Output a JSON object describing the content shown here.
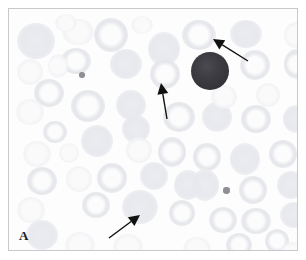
{
  "figure": {
    "panel_label": "A",
    "caption_alt": "Peripheral blood smear micrograph",
    "frame_color": "#c9c9cd",
    "background_color": "#fdfdfd"
  },
  "colors": {
    "background": "#fdfdfd",
    "red_blood_cell": "#e3e5e9",
    "leukocyte_dark": "#3b3b41",
    "platelet": "#8e8e93",
    "arrow": "#111111",
    "frame": "#c9c9cd"
  },
  "annotations": {
    "arrows": [
      {
        "id": "arrow-top-right",
        "label": "arrow-top-right",
        "direction": "up-left",
        "tip_x": 204,
        "tip_y": 30,
        "tail_x": 239,
        "tail_y": 52
      },
      {
        "id": "arrow-middle",
        "label": "arrow-middle",
        "direction": "up",
        "tip_x": 152,
        "tip_y": 74,
        "tail_x": 158,
        "tail_y": 110
      },
      {
        "id": "arrow-bottom",
        "label": "arrow-bottom",
        "direction": "up-right",
        "tip_x": 131,
        "tip_y": 206,
        "tail_x": 100,
        "tail_y": 229
      }
    ]
  },
  "cells": {
    "leukocyte": {
      "cx": 201,
      "cy": 62,
      "r": 19
    },
    "platelets": [
      {
        "cx": 73,
        "cy": 66,
        "r": 3
      },
      {
        "cx": 217,
        "cy": 181,
        "r": 3.5
      }
    ],
    "red_blood_cells": [
      {
        "cx": 27,
        "cy": 32,
        "rx": 19,
        "ry": 18,
        "style": "solid"
      },
      {
        "cx": 69,
        "cy": 23,
        "rx": 16,
        "ry": 13,
        "style": "faint"
      },
      {
        "cx": 67,
        "cy": 52,
        "rx": 15,
        "ry": 13,
        "style": "ring"
      },
      {
        "cx": 49,
        "cy": 57,
        "rx": 10,
        "ry": 12,
        "style": "faint"
      },
      {
        "cx": 102,
        "cy": 26,
        "rx": 17,
        "ry": 17,
        "style": "ring"
      },
      {
        "cx": 117,
        "cy": 55,
        "rx": 16,
        "ry": 15,
        "style": "solid"
      },
      {
        "cx": 155,
        "cy": 40,
        "rx": 16,
        "ry": 17,
        "style": "solid"
      },
      {
        "cx": 156,
        "cy": 65,
        "rx": 15,
        "ry": 15,
        "style": "ring"
      },
      {
        "cx": 190,
        "cy": 26,
        "rx": 17,
        "ry": 15,
        "style": "ring"
      },
      {
        "cx": 237,
        "cy": 25,
        "rx": 16,
        "ry": 14,
        "style": "solid"
      },
      {
        "cx": 246,
        "cy": 56,
        "rx": 15,
        "ry": 15,
        "style": "ring"
      },
      {
        "cx": 288,
        "cy": 55,
        "rx": 13,
        "ry": 15,
        "style": "ring"
      },
      {
        "cx": 287,
        "cy": 26,
        "rx": 12,
        "ry": 13,
        "style": "faint"
      },
      {
        "cx": 21,
        "cy": 63,
        "rx": 13,
        "ry": 13,
        "style": "faint"
      },
      {
        "cx": 40,
        "cy": 84,
        "rx": 15,
        "ry": 14,
        "style": "ring"
      },
      {
        "cx": 21,
        "cy": 103,
        "rx": 14,
        "ry": 13,
        "style": "faint"
      },
      {
        "cx": 79,
        "cy": 97,
        "rx": 17,
        "ry": 16,
        "style": "ring"
      },
      {
        "cx": 122,
        "cy": 96,
        "rx": 15,
        "ry": 15,
        "style": "solid"
      },
      {
        "cx": 127,
        "cy": 120,
        "rx": 14,
        "ry": 14,
        "style": "solid"
      },
      {
        "cx": 170,
        "cy": 108,
        "rx": 16,
        "ry": 15,
        "style": "ring"
      },
      {
        "cx": 208,
        "cy": 108,
        "rx": 15,
        "ry": 15,
        "style": "solid"
      },
      {
        "cx": 247,
        "cy": 110,
        "rx": 15,
        "ry": 14,
        "style": "ring"
      },
      {
        "cx": 287,
        "cy": 110,
        "rx": 13,
        "ry": 14,
        "style": "solid"
      },
      {
        "cx": 46,
        "cy": 123,
        "rx": 12,
        "ry": 11,
        "style": "ring"
      },
      {
        "cx": 88,
        "cy": 132,
        "rx": 16,
        "ry": 16,
        "style": "solid"
      },
      {
        "cx": 28,
        "cy": 145,
        "rx": 14,
        "ry": 13,
        "style": "faint"
      },
      {
        "cx": 130,
        "cy": 141,
        "rx": 13,
        "ry": 13,
        "style": "faint"
      },
      {
        "cx": 163,
        "cy": 143,
        "rx": 14,
        "ry": 15,
        "style": "ring"
      },
      {
        "cx": 198,
        "cy": 148,
        "rx": 14,
        "ry": 14,
        "style": "ring"
      },
      {
        "cx": 236,
        "cy": 150,
        "rx": 15,
        "ry": 16,
        "style": "solid"
      },
      {
        "cx": 274,
        "cy": 145,
        "rx": 14,
        "ry": 14,
        "style": "ring"
      },
      {
        "cx": 33,
        "cy": 172,
        "rx": 15,
        "ry": 14,
        "style": "ring"
      },
      {
        "cx": 70,
        "cy": 170,
        "rx": 13,
        "ry": 13,
        "style": "faint"
      },
      {
        "cx": 103,
        "cy": 169,
        "rx": 15,
        "ry": 15,
        "style": "ring"
      },
      {
        "cx": 145,
        "cy": 167,
        "rx": 14,
        "ry": 14,
        "style": "solid"
      },
      {
        "cx": 179,
        "cy": 176,
        "rx": 14,
        "ry": 15,
        "style": "solid"
      },
      {
        "cx": 196,
        "cy": 176,
        "rx": 14,
        "ry": 16,
        "style": "solid"
      },
      {
        "cx": 244,
        "cy": 181,
        "rx": 14,
        "ry": 14,
        "style": "ring"
      },
      {
        "cx": 282,
        "cy": 176,
        "rx": 14,
        "ry": 14,
        "style": "solid"
      },
      {
        "cx": 22,
        "cy": 201,
        "rx": 14,
        "ry": 13,
        "style": "faint"
      },
      {
        "cx": 87,
        "cy": 196,
        "rx": 14,
        "ry": 13,
        "style": "ring"
      },
      {
        "cx": 131,
        "cy": 198,
        "rx": 18,
        "ry": 17,
        "style": "solid"
      },
      {
        "cx": 173,
        "cy": 204,
        "rx": 13,
        "ry": 13,
        "style": "ring"
      },
      {
        "cx": 214,
        "cy": 211,
        "rx": 14,
        "ry": 13,
        "style": "ring"
      },
      {
        "cx": 247,
        "cy": 212,
        "rx": 15,
        "ry": 13,
        "style": "ring"
      },
      {
        "cx": 285,
        "cy": 206,
        "rx": 14,
        "ry": 13,
        "style": "solid"
      },
      {
        "cx": 33,
        "cy": 226,
        "rx": 16,
        "ry": 15,
        "style": "solid"
      },
      {
        "cx": 71,
        "cy": 236,
        "rx": 15,
        "ry": 13,
        "style": "faint"
      },
      {
        "cx": 119,
        "cy": 238,
        "rx": 15,
        "ry": 13,
        "style": "faint"
      },
      {
        "cx": 188,
        "cy": 240,
        "rx": 14,
        "ry": 12,
        "style": "faint"
      },
      {
        "cx": 230,
        "cy": 236,
        "rx": 13,
        "ry": 12,
        "style": "ring"
      },
      {
        "cx": 268,
        "cy": 232,
        "rx": 12,
        "ry": 12,
        "style": "ring"
      },
      {
        "cx": 283,
        "cy": 245,
        "rx": 13,
        "ry": 12,
        "style": "faint"
      },
      {
        "cx": 57,
        "cy": 14,
        "rx": 11,
        "ry": 9,
        "style": "faint"
      },
      {
        "cx": 133,
        "cy": 16,
        "rx": 11,
        "ry": 9,
        "style": "faint"
      },
      {
        "cx": 215,
        "cy": 88,
        "rx": 13,
        "ry": 12,
        "style": "faint"
      },
      {
        "cx": 60,
        "cy": 144,
        "rx": 10,
        "ry": 10,
        "style": "faint"
      },
      {
        "cx": 259,
        "cy": 86,
        "rx": 12,
        "ry": 12,
        "style": "faint"
      }
    ]
  }
}
